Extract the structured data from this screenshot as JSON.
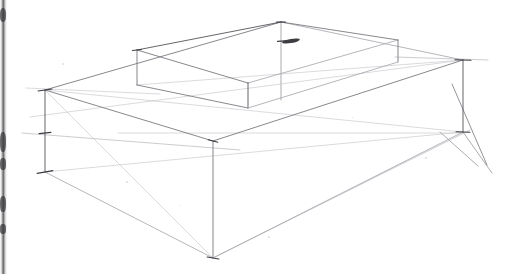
{
  "document": {
    "kind": "pencil-perspective-sketch",
    "medium": "graphite on white paper (scanned)",
    "subject": "Two-point perspective construction of a rectangular slab with a smaller rectangular box set on its top surface",
    "canvas": {
      "width": 509,
      "height": 274
    },
    "background_color": "#ffffff",
    "visible_text": []
  },
  "style": {
    "line_color_dark": "#4a4a50",
    "line_color_mid": "#73737a",
    "line_color_light": "#a9a9b0",
    "line_color_faint": "#c3c3c8",
    "tick_color": "#3d3d42",
    "stroke_width_main": 0.85,
    "stroke_width_construction": 0.6,
    "stroke_width_tick": 1.1
  },
  "page_edge": {
    "name": "scanned page binding edge",
    "x": 0,
    "width": 7,
    "color": "#4a4a4e",
    "blotches": [
      {
        "top": 8,
        "height": 14
      },
      {
        "top": 132,
        "height": 20
      },
      {
        "top": 158,
        "height": 12
      },
      {
        "top": 196,
        "height": 16
      },
      {
        "top": 224,
        "height": 10
      }
    ]
  },
  "geometry": {
    "vertices": {
      "slab_top_left": {
        "x": 45,
        "y": 90
      },
      "slab_top_back": {
        "x": 281,
        "y": 22
      },
      "slab_top_right": {
        "x": 463,
        "y": 60
      },
      "slab_top_front": {
        "x": 213,
        "y": 141
      },
      "slab_bottom_left": {
        "x": 45,
        "y": 172
      },
      "slab_bottom_right": {
        "x": 463,
        "y": 132
      },
      "slab_bottom_front": {
        "x": 213,
        "y": 258
      },
      "box_top_left": {
        "x": 137,
        "y": 50
      },
      "box_top_back": {
        "x": 281,
        "y": 22
      },
      "box_top_right": {
        "x": 398,
        "y": 40
      },
      "box_top_front": {
        "x": 248,
        "y": 83
      },
      "box_bottom_left": {
        "x": 137,
        "y": 85
      },
      "box_bottom_front": {
        "x": 248,
        "y": 108
      },
      "box_bottom_right": {
        "x": 398,
        "y": 62
      }
    },
    "slab_edges": [
      {
        "name": "slab-top-back-left-edge",
        "from": [
          45,
          90
        ],
        "to": [
          281,
          22
        ],
        "tone": "mid"
      },
      {
        "name": "slab-top-back-right-edge",
        "from": [
          281,
          22
        ],
        "to": [
          463,
          60
        ],
        "tone": "light"
      },
      {
        "name": "slab-top-front-right-edge",
        "from": [
          463,
          60
        ],
        "to": [
          213,
          141
        ],
        "tone": "mid"
      },
      {
        "name": "slab-top-front-left-edge",
        "from": [
          213,
          141
        ],
        "to": [
          45,
          90
        ],
        "tone": "mid"
      },
      {
        "name": "slab-left-vertical",
        "from": [
          45,
          90
        ],
        "to": [
          45,
          172
        ],
        "tone": "dark"
      },
      {
        "name": "slab-right-vertical",
        "from": [
          463,
          60
        ],
        "to": [
          463,
          132
        ],
        "tone": "dark"
      },
      {
        "name": "slab-front-vertical",
        "from": [
          213,
          141
        ],
        "to": [
          213,
          258
        ],
        "tone": "mid"
      },
      {
        "name": "slab-bottom-front-left-edge",
        "from": [
          45,
          172
        ],
        "to": [
          213,
          258
        ],
        "tone": "light"
      },
      {
        "name": "slab-bottom-front-right-edge",
        "from": [
          213,
          258
        ],
        "to": [
          463,
          132
        ],
        "tone": "light"
      }
    ],
    "box_edges": [
      {
        "name": "box-top-back-left-edge",
        "from": [
          137,
          50
        ],
        "to": [
          281,
          22
        ],
        "tone": "dark"
      },
      {
        "name": "box-top-back-right-edge",
        "from": [
          281,
          22
        ],
        "to": [
          398,
          40
        ],
        "tone": "mid"
      },
      {
        "name": "box-top-front-right-edge",
        "from": [
          398,
          40
        ],
        "to": [
          248,
          83
        ],
        "tone": "light"
      },
      {
        "name": "box-top-front-left-edge",
        "from": [
          248,
          83
        ],
        "to": [
          137,
          50
        ],
        "tone": "mid"
      },
      {
        "name": "box-left-vertical",
        "from": [
          137,
          50
        ],
        "to": [
          137,
          85
        ],
        "tone": "mid"
      },
      {
        "name": "box-front-vertical",
        "from": [
          248,
          83
        ],
        "to": [
          248,
          108
        ],
        "tone": "dark"
      },
      {
        "name": "box-right-vertical",
        "from": [
          398,
          40
        ],
        "to": [
          398,
          62
        ],
        "tone": "mid"
      },
      {
        "name": "box-bottom-front-left-edge",
        "from": [
          137,
          85
        ],
        "to": [
          248,
          108
        ],
        "tone": "mid"
      },
      {
        "name": "box-bottom-front-right-edge",
        "from": [
          248,
          108
        ],
        "to": [
          398,
          62
        ],
        "tone": "light"
      }
    ],
    "construction_lines": [
      {
        "name": "center-measuring-vertical",
        "from": [
          281,
          22
        ],
        "to": [
          281,
          100
        ],
        "tone": "mid"
      },
      {
        "name": "left-horizon-guide",
        "from": [
          22,
          133
        ],
        "to": [
          240,
          150
        ],
        "tone": "light"
      },
      {
        "name": "left-upper-horizon-guide",
        "from": [
          26,
          88
        ],
        "to": [
          160,
          94
        ],
        "tone": "faint"
      },
      {
        "name": "right-horizon-guide",
        "from": [
          395,
          57
        ],
        "to": [
          488,
          60
        ],
        "tone": "light"
      },
      {
        "name": "receding-guide-left-to-right-vp",
        "from": [
          45,
          90
        ],
        "to": [
          463,
          132
        ],
        "tone": "faint"
      },
      {
        "name": "receding-guide-box-left-to-vp",
        "from": [
          137,
          85
        ],
        "to": [
          463,
          60
        ],
        "tone": "faint"
      },
      {
        "name": "receding-guide-upper-left-to-vp",
        "from": [
          30,
          117
        ],
        "to": [
          463,
          60
        ],
        "tone": "faint"
      },
      {
        "name": "receding-guide-lower-left",
        "from": [
          45,
          172
        ],
        "to": [
          463,
          132
        ],
        "tone": "faint"
      },
      {
        "name": "diagonal-cross-left",
        "from": [
          45,
          90
        ],
        "to": [
          213,
          258
        ],
        "tone": "faint"
      },
      {
        "name": "vp-convergence-upper",
        "from": [
          452,
          84
        ],
        "to": [
          487,
          165
        ],
        "tone": "dark"
      },
      {
        "name": "vp-convergence-lower",
        "from": [
          463,
          132
        ],
        "to": [
          492,
          173
        ],
        "tone": "mid"
      },
      {
        "name": "vp-convergence-inner",
        "from": [
          440,
          132
        ],
        "to": [
          478,
          166
        ],
        "tone": "mid"
      },
      {
        "name": "slab-diagonal-to-right-corner",
        "from": [
          213,
          258
        ],
        "to": [
          470,
          130
        ],
        "tone": "light"
      },
      {
        "name": "slab-inner-diagonal",
        "from": [
          118,
          133
        ],
        "to": [
          463,
          133
        ],
        "tone": "faint"
      }
    ],
    "tick_marks": [
      {
        "name": "tick-slab-top-left",
        "cx": 45,
        "cy": 90,
        "len": 14,
        "angle": -8
      },
      {
        "name": "tick-slab-bottom-left",
        "cx": 45,
        "cy": 172,
        "len": 16,
        "angle": -10
      },
      {
        "name": "tick-slab-mid-left",
        "cx": 45,
        "cy": 133,
        "len": 12,
        "angle": -6
      },
      {
        "name": "tick-slab-top-right",
        "cx": 463,
        "cy": 60,
        "len": 16,
        "angle": 2
      },
      {
        "name": "tick-slab-bottom-right",
        "cx": 463,
        "cy": 132,
        "len": 14,
        "angle": 2
      },
      {
        "name": "tick-slab-top-front",
        "cx": 213,
        "cy": 141,
        "len": 10,
        "angle": 14
      },
      {
        "name": "tick-slab-bottom-front",
        "cx": 213,
        "cy": 258,
        "len": 12,
        "angle": 10
      },
      {
        "name": "tick-box-top-back",
        "cx": 281,
        "cy": 22,
        "len": 9,
        "angle": 0
      },
      {
        "name": "tick-box-measuring",
        "cx": 283,
        "cy": 41,
        "len": 11,
        "angle": -4
      },
      {
        "name": "tick-box-top-left",
        "cx": 137,
        "cy": 50,
        "len": 9,
        "angle": -6
      }
    ],
    "accent_marks": [
      {
        "name": "graphite-smudge-apex",
        "cx": 291,
        "cy": 41,
        "rx": 9,
        "ry": 2,
        "angle": -9
      }
    ],
    "paper_specks": [
      {
        "x": 62,
        "y": 63,
        "size": 2
      },
      {
        "x": 126,
        "y": 181,
        "size": 2
      },
      {
        "x": 268,
        "y": 236,
        "size": 2
      },
      {
        "x": 425,
        "y": 157,
        "size": 2
      },
      {
        "x": 352,
        "y": 117,
        "size": 1
      },
      {
        "x": 180,
        "y": 205,
        "size": 1
      }
    ]
  }
}
